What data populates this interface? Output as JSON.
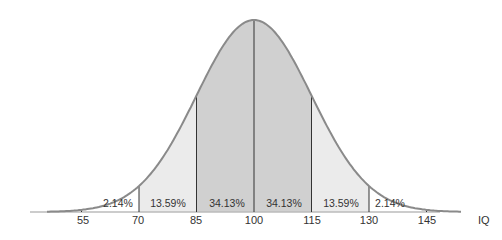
{
  "chart_data": {
    "type": "area",
    "title": "",
    "xlabel": "IQ",
    "ylabel": "",
    "mean": 100,
    "sd": 15,
    "x_ticks": [
      55,
      70,
      85,
      100,
      115,
      130,
      145
    ],
    "x_tick_labels": [
      "55",
      "70",
      "85",
      "100",
      "115",
      "130",
      "145"
    ],
    "regions": [
      {
        "from": 55,
        "to": 70,
        "percent": 2.14,
        "label": "2.14%"
      },
      {
        "from": 70,
        "to": 85,
        "percent": 13.59,
        "label": "13.59%"
      },
      {
        "from": 85,
        "to": 100,
        "percent": 34.13,
        "label": "34.13%"
      },
      {
        "from": 100,
        "to": 115,
        "percent": 34.13,
        "label": "34.13%"
      },
      {
        "from": 115,
        "to": 130,
        "percent": 13.59,
        "label": "13.59%"
      },
      {
        "from": 130,
        "to": 145,
        "percent": 2.14,
        "label": "2.14%"
      }
    ],
    "grid": false,
    "legend": "none"
  },
  "colors": {
    "curve": "#8a8a8a",
    "outer_fill": "#ffffff",
    "mid_fill": "#ebebeb",
    "center_fill": "#d0d0d0",
    "axis": "#bbbbbb",
    "divider": "#333333"
  }
}
